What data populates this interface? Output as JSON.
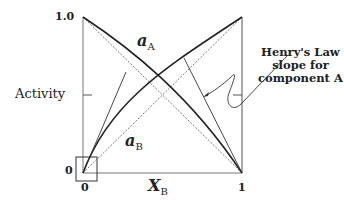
{
  "figure": {
    "y_axis_title": "Activity",
    "x_axis_title_main": "X",
    "x_axis_title_sub": "B",
    "y_tick_top": "1.0",
    "y_tick_bottom": "0",
    "x_tick_left": "0",
    "x_tick_right": "1",
    "curve_a_label_main": "a",
    "curve_a_label_sub": "A",
    "curve_b_label_main": "a",
    "curve_b_label_sub": "B",
    "annotation_line1": "Henry's Law",
    "annotation_line2": "slope for",
    "annotation_line3": "component A"
  },
  "colors": {
    "line": "#2a2a2a",
    "axis": "#555555",
    "dashed": "#555555"
  }
}
